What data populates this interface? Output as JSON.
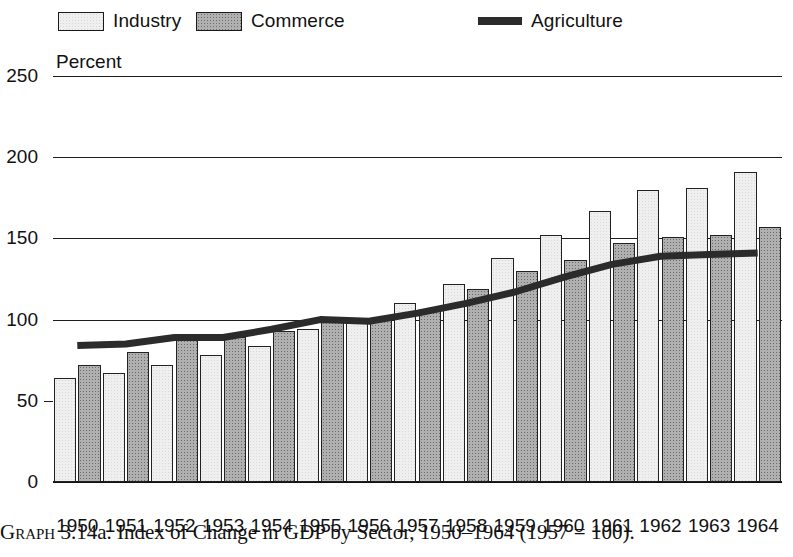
{
  "legend": {
    "items": [
      {
        "label": "Industry",
        "marker": "light-stipple-swatch",
        "color": "#efefef"
      },
      {
        "label": "Commerce",
        "marker": "dark-stipple-swatch",
        "color": "#b0b0b0"
      },
      {
        "label": "Agriculture",
        "marker": "thick-line",
        "color": "#2b2b2b"
      }
    ]
  },
  "axis": {
    "y_title": "Percent",
    "y_ticks": [
      "250",
      "200",
      "150",
      "100",
      "50",
      "0"
    ]
  },
  "caption": {
    "graph_word": "Graph",
    "text": " 3.14a. Index of Change in GDP by Sector, 1950–1964 (1957 = 100)."
  },
  "chart_data": {
    "type": "bar",
    "title": "Index of Change in GDP by Sector, 1950–1964 (1957 = 100)",
    "xlabel": "",
    "ylabel": "Percent",
    "ylim": [
      0,
      250
    ],
    "yticks": [
      0,
      50,
      100,
      150,
      200,
      250
    ],
    "grid": true,
    "gridlines_at": [
      100,
      150,
      200,
      250
    ],
    "legend_position": "top",
    "categories": [
      "1950",
      "1951",
      "1952",
      "1953",
      "1954",
      "1955",
      "1956",
      "1957",
      "1958",
      "1959",
      "1960",
      "1961",
      "1962",
      "1963",
      "1964"
    ],
    "series": [
      {
        "name": "Industry",
        "type": "bar",
        "values": [
          64,
          67,
          72,
          78,
          84,
          94,
          101,
          110,
          122,
          138,
          152,
          167,
          180,
          181,
          191
        ]
      },
      {
        "name": "Commerce",
        "type": "bar",
        "values": [
          72,
          80,
          88,
          89,
          93,
          99,
          100,
          105,
          119,
          130,
          137,
          147,
          151,
          152,
          157
        ]
      },
      {
        "name": "Agriculture",
        "type": "line",
        "values": [
          84,
          85,
          89,
          89,
          94,
          100,
          99,
          104,
          110,
          117,
          126,
          134,
          139,
          140,
          141
        ]
      }
    ]
  }
}
